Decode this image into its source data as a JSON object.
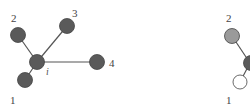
{
  "diagrams": [
    {
      "name": "star-graph-left",
      "center_label": "i",
      "nodes": [
        {
          "id": "i",
          "label": "i",
          "fill": "#5a5a5a"
        },
        {
          "id": "1",
          "label": "1",
          "fill": "#5a5a5a"
        },
        {
          "id": "2",
          "label": "2",
          "fill": "#5a5a5a"
        },
        {
          "id": "3",
          "label": "3",
          "fill": "#5a5a5a"
        },
        {
          "id": "4",
          "label": "4",
          "fill": "#5a5a5a"
        }
      ],
      "edges": [
        [
          "i",
          "1"
        ],
        [
          "i",
          "2"
        ],
        [
          "i",
          "3"
        ],
        [
          "i",
          "4"
        ]
      ]
    },
    {
      "name": "graph-right-partial",
      "nodes": [
        {
          "id": "2",
          "label": "2",
          "fill": "#9a9a9a"
        },
        {
          "id": "c",
          "label": "",
          "fill": "#5a5a5a"
        },
        {
          "id": "1",
          "label": "1",
          "fill": "#ffffff"
        }
      ],
      "edges": [
        [
          "c",
          "2"
        ],
        [
          "c",
          "1"
        ]
      ]
    }
  ],
  "colors": {
    "dark_node": "#5a5a5a",
    "gray_node": "#9a9a9a",
    "white_node": "#ffffff",
    "edge": "#555555",
    "outline": "#444444"
  }
}
